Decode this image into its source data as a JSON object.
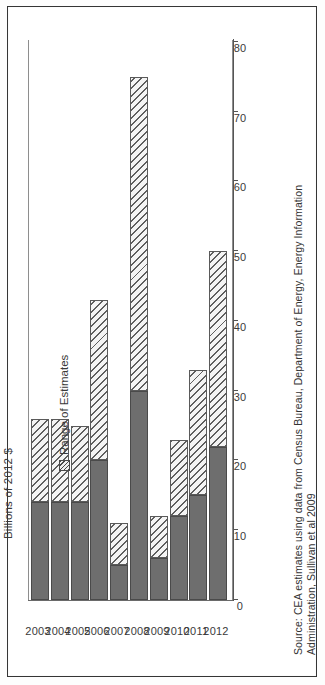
{
  "figure": {
    "axis_title": "Billions of 2012 $",
    "source_lines": [
      "Source: CEA estimates using data from Census Bureau, Department of Energy, Energy Information",
      "Administration, Sullivan et al 2009"
    ]
  },
  "legend": {
    "swatch_name": "hatched-swatch",
    "label": "Range of Estimates"
  },
  "colors": {
    "low_estimate": "#6e6e6e",
    "range_hatch": "#f4f4f4",
    "axis": "#555555",
    "frame": "#3a3a3a"
  },
  "chart_data": {
    "type": "bar",
    "orientation": "vertical-printed-sideways",
    "stacked": true,
    "title": "",
    "subtitle": "",
    "xlabel": "",
    "ylabel": "Billions of 2012 $",
    "ylim": [
      0,
      80
    ],
    "yticks": [
      0,
      10,
      20,
      30,
      40,
      50,
      60,
      70,
      80
    ],
    "ytick_labels": [
      "0",
      "10",
      "20",
      "30",
      "40",
      "50",
      "60",
      "70",
      "80"
    ],
    "grid": false,
    "legend_position": "inside-upper-left",
    "categories": [
      "2003",
      "2004",
      "2005",
      "2006",
      "2007",
      "2008",
      "2009",
      "2010",
      "2011",
      "2012"
    ],
    "series": [
      {
        "name": "Low estimate",
        "fill": "solid-dark-gray",
        "values": [
          14,
          14,
          14,
          20,
          5,
          30,
          6,
          12,
          15,
          22
        ]
      },
      {
        "name": "Range of Estimates",
        "fill": "diagonal-hatch",
        "values": [
          12,
          12,
          11,
          23,
          6,
          45,
          6,
          11,
          18,
          28
        ]
      }
    ],
    "totals": [
      26,
      26,
      25,
      43,
      11,
      75,
      12,
      23,
      33,
      50
    ],
    "legend_entries": [
      "Range of Estimates"
    ]
  },
  "ticks": [
    {
      "label": "80",
      "value": 80
    },
    {
      "label": "70",
      "value": 70
    },
    {
      "label": "60",
      "value": 60
    },
    {
      "label": "50",
      "value": 50
    },
    {
      "label": "40",
      "value": 40
    },
    {
      "label": "30",
      "value": 30
    },
    {
      "label": "20",
      "value": 20
    },
    {
      "label": "10",
      "value": 10
    },
    {
      "label": "0",
      "value": 0
    }
  ]
}
